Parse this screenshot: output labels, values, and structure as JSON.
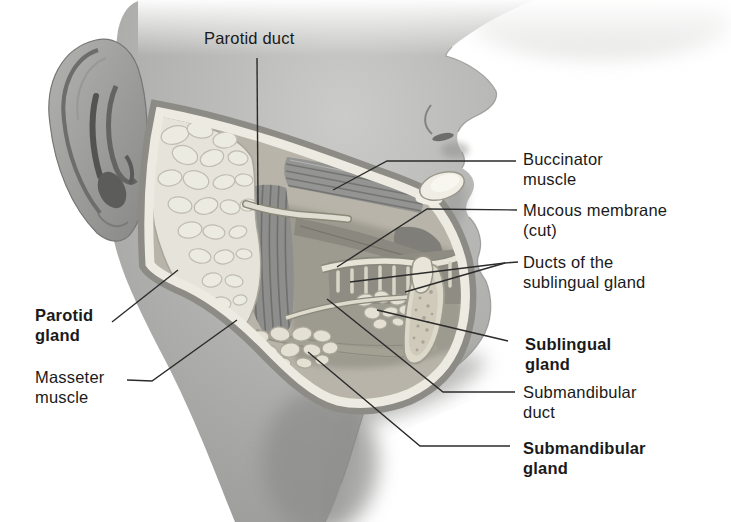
{
  "diagram": {
    "labels": [
      {
        "id": "parotid-duct",
        "text": "Parotid duct",
        "bold": false
      },
      {
        "id": "buccinator-muscle",
        "text": "Buccinator muscle",
        "bold": false
      },
      {
        "id": "mucous-membrane-cut",
        "text": "Mucous membrane (cut)",
        "bold": false
      },
      {
        "id": "ducts-of-sublingual",
        "text": "Ducts of the sublingual gland",
        "bold": false
      },
      {
        "id": "sublingual-gland",
        "text": "Sublingual gland",
        "bold": true
      },
      {
        "id": "submandibular-duct",
        "text": "Submandibular duct",
        "bold": false
      },
      {
        "id": "submandibular-gland",
        "text": "Submandibular gland",
        "bold": true
      },
      {
        "id": "parotid-gland",
        "text": "Parotid gland",
        "bold": true
      },
      {
        "id": "masseter-muscle",
        "text": "Masseter muscle",
        "bold": false
      }
    ],
    "colors": {
      "background": "#ffffff",
      "label_text": "#1a1a1a",
      "leader_line": "#2b2b2b",
      "skin": "#b2b2b0",
      "gland_tissue": "#ecebe2",
      "cut_edge_band": "#edebe1",
      "muscle": "#8e8e8c"
    }
  }
}
